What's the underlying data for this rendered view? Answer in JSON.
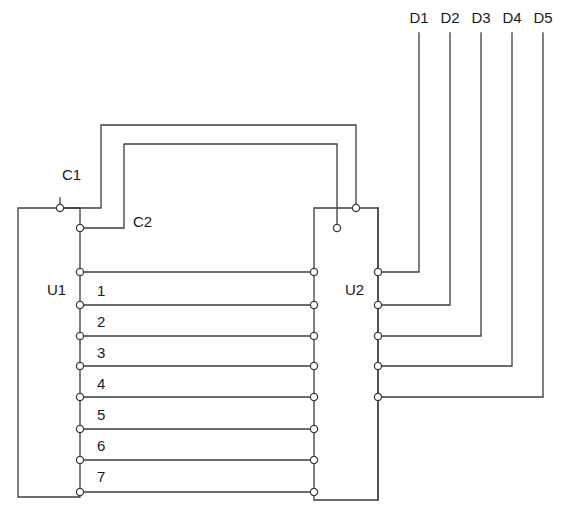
{
  "diagram": {
    "blocks": [
      {
        "id": "U1",
        "label": "U1",
        "label_x": 47,
        "label_y": 291,
        "x": 18,
        "y": 208,
        "w": 62,
        "h": 289
      },
      {
        "id": "U2",
        "label": "U2",
        "label_x": 345,
        "label_y": 291,
        "x": 314,
        "y": 208,
        "w": 64,
        "h": 292
      }
    ],
    "control_lines": [
      {
        "label": "C1",
        "label_x": 62,
        "label_y": 176,
        "start_x": 60,
        "start_y": 208,
        "rise_x": 101,
        "rail_y": 125,
        "end_x": 356,
        "end_y": 208
      },
      {
        "label": "C2",
        "label_x": 133,
        "label_y": 223,
        "start_x": 80,
        "start_y": 228,
        "rise_x": 124,
        "rail_y": 144,
        "end_x": 337,
        "end_y": 228
      }
    ],
    "pin_rows": [
      {
        "label": "1",
        "label_x": 97,
        "label_y": 292,
        "y": 272
      },
      {
        "label": "2",
        "label_x": 97,
        "label_y": 323,
        "y": 305
      },
      {
        "label": "3",
        "label_x": 97,
        "label_y": 354,
        "y": 336
      },
      {
        "label": "4",
        "label_x": 97,
        "label_y": 385,
        "y": 366
      },
      {
        "label": "5",
        "label_x": 97,
        "label_y": 416,
        "y": 397
      },
      {
        "label": "6",
        "label_x": 97,
        "label_y": 447,
        "y": 429
      },
      {
        "label": "7",
        "label_x": 97,
        "label_y": 478,
        "y": 460
      },
      {
        "label": "",
        "label_x": 97,
        "label_y": 505,
        "y": 492
      }
    ],
    "d_lines": [
      {
        "label": "D1",
        "label_x": 419,
        "label_y": 19,
        "x": 419,
        "top_y": 33,
        "tap_y": 272
      },
      {
        "label": "D2",
        "label_x": 450,
        "label_y": 19,
        "x": 450,
        "top_y": 33,
        "tap_y": 305
      },
      {
        "label": "D3",
        "label_x": 481,
        "label_y": 19,
        "x": 481,
        "top_y": 33,
        "tap_y": 336
      },
      {
        "label": "D4",
        "label_x": 512,
        "label_y": 19,
        "x": 512,
        "top_y": 33,
        "tap_y": 366
      },
      {
        "label": "D5",
        "label_x": 543,
        "label_y": 19,
        "x": 543,
        "top_y": 33,
        "tap_y": 397
      }
    ],
    "colors": {
      "line": "#3c3c3c",
      "text": "#1a1a1a",
      "background": "#ffffff",
      "terminal_fill": "#ffffff"
    },
    "geometry": {
      "u1_right_x": 80,
      "u1_left_x": 18,
      "u2_left_x": 314,
      "u2_right_x": 378,
      "u1_c1_terminal_x": 60,
      "u1_c1_terminal_y": 208,
      "u1_top_y": 208,
      "u1_bottom_y": 497,
      "u2_top_y": 208,
      "u2_bottom_y": 500,
      "u2_top_terminal_a_x": 337,
      "u2_top_terminal_b_x": 356,
      "terminal_radius": 3.6
    }
  }
}
